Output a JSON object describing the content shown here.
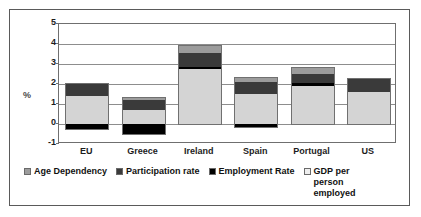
{
  "chart_data": {
    "type": "bar",
    "subtype": "stacked",
    "title": "",
    "xlabel": "",
    "ylabel": "%",
    "ylim": [
      -1,
      5
    ],
    "ytick_values": [
      5,
      4,
      3,
      2,
      1,
      0,
      -1
    ],
    "ytick_labels": [
      "5",
      "4",
      "3",
      "2",
      "1",
      "0",
      "-1"
    ],
    "grid": true,
    "legend_position": "bottom",
    "categories": [
      "EU",
      "Greece",
      "Ireland",
      "Spain",
      "Portugal",
      "US"
    ],
    "series": [
      {
        "name": "Age Dependency",
        "color": "#9c9c9c",
        "values": [
          0.0,
          0.1,
          0.35,
          0.2,
          0.3,
          0.0
        ]
      },
      {
        "name": "Participation rate",
        "color": "#3a3a3a",
        "values": [
          0.6,
          0.5,
          0.7,
          0.6,
          0.45,
          0.65
        ]
      },
      {
        "name": "Employment Rate",
        "color": "#000000",
        "values": [
          -0.25,
          -0.5,
          0.1,
          -0.15,
          0.15,
          0.0
        ]
      },
      {
        "name": "GDP per person employed",
        "color": "#d4d4d4",
        "values": [
          1.4,
          0.7,
          2.75,
          1.5,
          1.9,
          1.6
        ]
      }
    ],
    "bar_totals": [
      2.05,
      1.45,
      4.15,
      2.6,
      2.95,
      2.28
    ]
  },
  "axis": {
    "y_title": "%",
    "y_ticks": [
      "5",
      "4",
      "3",
      "2",
      "1",
      "0",
      "-1"
    ],
    "x_categories": [
      "EU",
      "Greece",
      "Ireland",
      "Spain",
      "Portugal",
      "US"
    ]
  },
  "legend": {
    "items": [
      {
        "label": "Age Dependency",
        "color": "#9c9c9c"
      },
      {
        "label": "Participation rate",
        "color": "#3a3a3a"
      },
      {
        "label": "Employment Rate",
        "color": "#000000"
      },
      {
        "label": "GDP per person employed",
        "color": "#eeeeee"
      }
    ]
  }
}
